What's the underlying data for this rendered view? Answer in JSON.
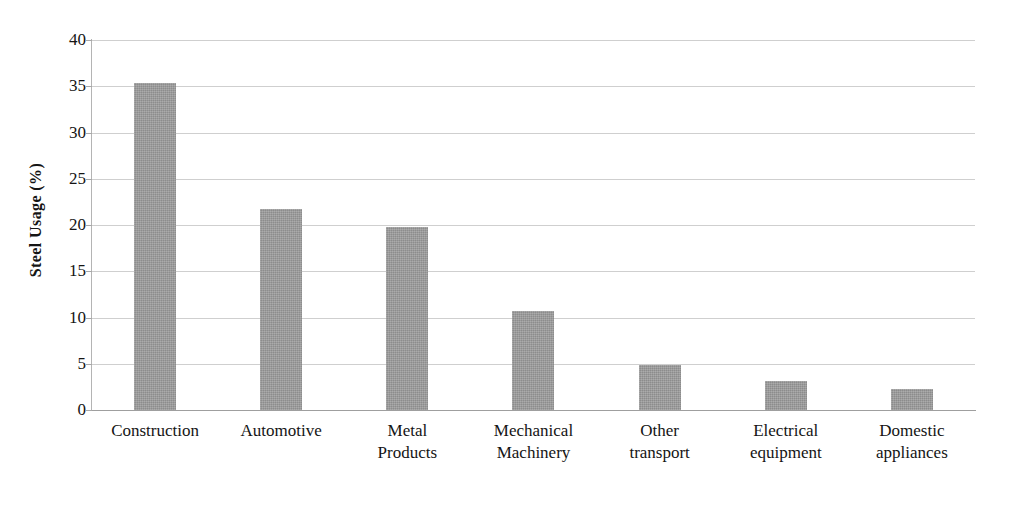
{
  "chart_data": {
    "type": "bar",
    "title": "",
    "xlabel": "",
    "ylabel": "Steel Usage (%)",
    "categories": [
      "Construction",
      "Automotive",
      "Metal Products",
      "Mechanical Machinery",
      "Other transport",
      "Electrical equipment",
      "Domestic appliances"
    ],
    "category_lines": [
      [
        "Construction"
      ],
      [
        "Automotive"
      ],
      [
        "Metal",
        "Products"
      ],
      [
        "Mechanical",
        "Machinery"
      ],
      [
        "Other",
        "transport"
      ],
      [
        "Electrical",
        "equipment"
      ],
      [
        "Domestic",
        "appliances"
      ]
    ],
    "values": [
      35.3,
      21.7,
      19.8,
      10.7,
      4.9,
      3.1,
      2.3
    ],
    "ylim": [
      0,
      40
    ],
    "yticks": [
      40,
      35,
      30,
      25,
      20,
      15,
      10,
      5,
      0
    ],
    "ytick_labels": [
      "40",
      "35",
      "30",
      "25",
      "20",
      "15",
      "10",
      "5",
      "0"
    ],
    "grid": "horizontal",
    "legend": "none",
    "bar_color": "#9a9a9a",
    "grid_color": "#cfcfcf",
    "axis_color": "#9f9f9f",
    "text_color": "#141414"
  }
}
